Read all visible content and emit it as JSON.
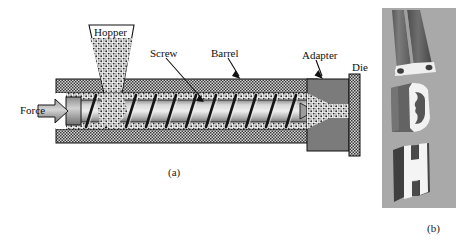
{
  "figure": {
    "panels": [
      {
        "id": "a",
        "caption": "(a)",
        "description": "Cross-sectional schematic of a single-screw extruder"
      },
      {
        "id": "b",
        "caption": "(b)",
        "description": "Photograph of three extruded plastic profiles"
      }
    ]
  },
  "panel_a": {
    "caption": "(a)",
    "labels": {
      "force": "Force",
      "hopper": "Hopper",
      "screw": "Screw",
      "barrel": "Barrel",
      "adapter": "Adapter",
      "die": "Die"
    },
    "components": [
      {
        "name": "force-arrow",
        "label": "Force",
        "kind": "arrow",
        "direction": "right"
      },
      {
        "name": "hopper",
        "label": "Hopper",
        "kind": "trapezoid",
        "fill": "pellet-speckle"
      },
      {
        "name": "barrel",
        "label": "Barrel",
        "kind": "wall",
        "fill": "checker-hatch"
      },
      {
        "name": "screw",
        "label": "Screw",
        "kind": "helical-shaft",
        "fill": "gray-gradient"
      },
      {
        "name": "adapter",
        "label": "Adapter",
        "kind": "block",
        "fill": "solid-gray"
      },
      {
        "name": "die",
        "label": "Die",
        "kind": "plate",
        "fill": "checker-hatch"
      }
    ]
  },
  "panel_b": {
    "caption": "(b)",
    "background_color": "#a9a9a9",
    "items": [
      {
        "name": "twin-tube-profile",
        "position": "top",
        "body_color": "#6e6e6e",
        "face_color": "#efefef",
        "bores": 2
      },
      {
        "name": "c-channel-profile",
        "position": "middle",
        "body_color": "#5f5f5f",
        "face_color": "#f2f2f2",
        "bores": 1
      },
      {
        "name": "h-section-profile",
        "position": "bottom",
        "body_color": "#4a4a4a",
        "face_color": "#f4f4f4",
        "bores": 0
      }
    ]
  },
  "colors": {
    "ink": "#111111",
    "barrel_wall": "#9a9a9a",
    "adapter_gray": "#7b7b7b",
    "melt_speckle": "#e8e8e8",
    "panel_b_bg": "#a9a9a9",
    "page_bg": "#ffffff"
  }
}
